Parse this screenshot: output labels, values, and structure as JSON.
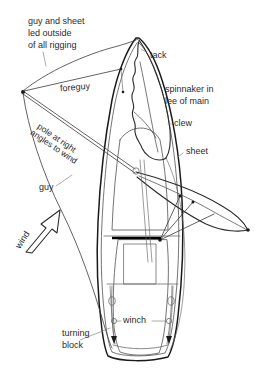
{
  "diagram": {
    "background_color": "#ffffff",
    "ink_color": "#1a1a1a",
    "text_color": "#2b2b2b",
    "labels": {
      "guy_and_sheet_1": "guy and sheet",
      "guy_and_sheet_2": "led outside",
      "guy_and_sheet_3": "of all rigging",
      "tack": "tack",
      "foreguy": "foreguy",
      "spinnaker_1": "spinnaker in",
      "spinnaker_2": "lee of main",
      "clew": "clew",
      "sheet": "sheet",
      "pole_1": "pole at right",
      "pole_2": "angles to wind",
      "guy": "guy",
      "wind": "wind",
      "winch": "winch",
      "turning_1": "turning",
      "turning_2": "block"
    }
  }
}
